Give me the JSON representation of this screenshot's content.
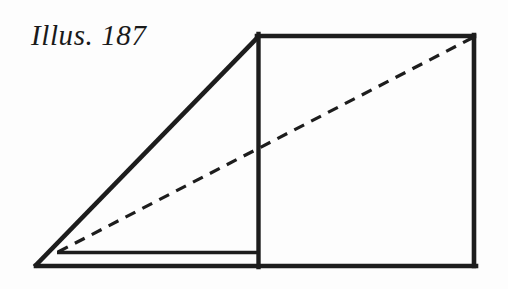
{
  "figure": {
    "caption": "Illus. 187",
    "background_color": "#fdfdfd",
    "ink_color": "#1d1d1d",
    "canvas": {
      "width": 508,
      "height": 289
    },
    "geometry": {
      "points": {
        "bottom_left_apex": [
          36,
          265
        ],
        "top_of_slant": [
          259,
          36
        ],
        "top_right": [
          474,
          36
        ],
        "bottom_right": [
          474,
          266
        ],
        "bottom_center": [
          259,
          266
        ],
        "ledge_left": [
          57,
          252
        ],
        "ledge_right": [
          259,
          252
        ],
        "dashed_start": [
          58,
          252
        ],
        "dashed_end": [
          472,
          38
        ]
      },
      "stroke_widths": {
        "outline": 4.6,
        "inner_ledge": 3.4,
        "dashed": 3.2
      },
      "dash_pattern": "11 8"
    },
    "elements": [
      {
        "name": "slant-edge",
        "kind": "solid-line",
        "from": "bottom_left_apex",
        "to": "top_of_slant"
      },
      {
        "name": "top-edge",
        "kind": "solid-line",
        "from": "top_of_slant",
        "to": "top_right"
      },
      {
        "name": "right-edge",
        "kind": "solid-line",
        "from": "top_right",
        "to": "bottom_right"
      },
      {
        "name": "bottom-edge",
        "kind": "solid-line",
        "from": "bottom_right",
        "to": "bottom_left_apex"
      },
      {
        "name": "center-vertical-edge",
        "kind": "solid-line",
        "from": "top_of_slant",
        "to": "bottom_center"
      },
      {
        "name": "inner-ledge-line",
        "kind": "solid-line",
        "from": "ledge_left",
        "to": "ledge_right"
      },
      {
        "name": "dashed-diagonal",
        "kind": "dashed-line",
        "from": "dashed_start",
        "to": "dashed_end"
      }
    ]
  }
}
